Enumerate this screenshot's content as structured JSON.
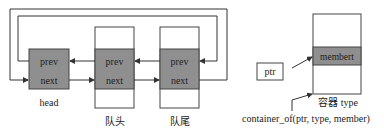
{
  "diagram": {
    "left": {
      "head": {
        "prev": "prev",
        "next": "next",
        "label": "head"
      },
      "nodes": [
        {
          "prev": "prev",
          "next": "next",
          "label": "队头"
        },
        {
          "prev": "prev",
          "next": "next",
          "label": "队尾"
        }
      ]
    },
    "right": {
      "ptr_label": "ptr",
      "member_label": "membert",
      "container_label": "容器 type",
      "macro_label": "container_of(ptr, type, member)"
    },
    "colors": {
      "gray_fill": "#8f8f8f",
      "line": "#333333",
      "box_stroke": "#444444"
    }
  }
}
